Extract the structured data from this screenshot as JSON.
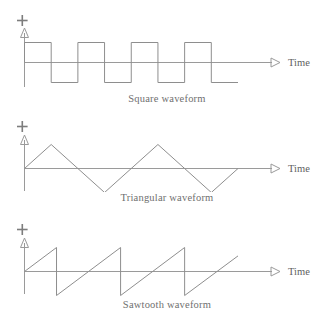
{
  "page": {
    "background_color": "#ffffff",
    "line_color": "#9a9a9a",
    "text_color": "#6e6e6e",
    "width": 316,
    "height": 319
  },
  "figures": [
    {
      "id": "square",
      "caption": "Square waveform",
      "axis": {
        "time_label": "Time",
        "plus_sign": "+",
        "minus_sign": "–",
        "vertical_arrow_icon": "up-triangle-outline",
        "horizontal_arrow_icon": "right-triangle-outline"
      },
      "chart_data": {
        "type": "line",
        "title": "Square waveform",
        "xlabel": "Time",
        "ylabel": "",
        "grid": false,
        "legend": "none",
        "xlim": [
          0,
          8
        ],
        "ylim": [
          -1,
          1
        ],
        "x": [
          0.0,
          0.0,
          1.0,
          1.0,
          2.0,
          2.0,
          3.0,
          3.0,
          4.0,
          4.0,
          5.0,
          5.0,
          6.0,
          6.0,
          7.0,
          7.0,
          8.0
        ],
        "y": [
          0,
          1,
          1,
          -1,
          -1,
          1,
          1,
          -1,
          -1,
          1,
          1,
          -1,
          -1,
          1,
          1,
          -1,
          -1
        ],
        "amplitude": 1,
        "period": 2,
        "cycles": 3.5
      }
    },
    {
      "id": "triangle",
      "caption": "Triangular waveform",
      "axis": {
        "time_label": "Time",
        "plus_sign": "+",
        "minus_sign": "–",
        "vertical_arrow_icon": "up-triangle-outline",
        "horizontal_arrow_icon": "right-triangle-outline"
      },
      "chart_data": {
        "type": "line",
        "title": "Triangular waveform",
        "xlabel": "Time",
        "ylabel": "",
        "grid": false,
        "legend": "none",
        "xlim": [
          0,
          8
        ],
        "ylim": [
          -1,
          1
        ],
        "x": [
          0.0,
          1.0,
          3.0,
          5.0,
          7.0,
          8.0
        ],
        "y": [
          0,
          1,
          -1,
          1,
          -1,
          0
        ],
        "amplitude": 1,
        "period": 4,
        "cycles": 2
      }
    },
    {
      "id": "sawtooth",
      "caption": "Sawtooth waveform",
      "axis": {
        "time_label": "Time",
        "plus_sign": "+",
        "minus_sign": "–",
        "vertical_arrow_icon": "up-triangle-outline",
        "horizontal_arrow_icon": "right-triangle-outline"
      },
      "chart_data": {
        "type": "line",
        "title": "Sawtooth waveform",
        "xlabel": "Time",
        "ylabel": "",
        "grid": false,
        "legend": "none",
        "xlim": [
          0,
          8
        ],
        "ylim": [
          -1,
          1
        ],
        "x": [
          0.0,
          1.2,
          1.2,
          3.6,
          3.6,
          6.0,
          6.0,
          8.0
        ],
        "y": [
          0,
          1,
          -1,
          1,
          -1,
          1,
          -1,
          0.65
        ],
        "amplitude": 1,
        "period": 2.4,
        "cycles": 3
      }
    }
  ]
}
